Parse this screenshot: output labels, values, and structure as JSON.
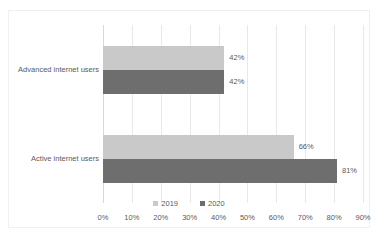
{
  "chart_data": {
    "type": "bar",
    "orientation": "horizontal",
    "title": "",
    "xlabel": "",
    "ylabel": "",
    "categories": [
      "Advanced internet users",
      "Active internet users"
    ],
    "series": [
      {
        "name": "2019",
        "color": "#c9c9c9",
        "values": [
          42,
          66
        ],
        "labels": [
          "42%",
          "66%"
        ]
      },
      {
        "name": "2020",
        "color": "#6e6e6e",
        "values": [
          42,
          81
        ],
        "labels": [
          "42%",
          "81%"
        ]
      }
    ],
    "xlim": [
      0,
      90
    ],
    "xticks": [
      0,
      10,
      20,
      30,
      40,
      50,
      60,
      70,
      80,
      90
    ],
    "xticklabels": [
      "0%",
      "10%",
      "20%",
      "30%",
      "40%",
      "50%",
      "60%",
      "70%",
      "80%",
      "90%"
    ],
    "grid": true,
    "grid_axis": "x",
    "legend_position": "bottom",
    "value_labels": true,
    "background_color": "#ffffff",
    "border_color": "#f0f0f0",
    "text_color": "#5a5a5a"
  }
}
